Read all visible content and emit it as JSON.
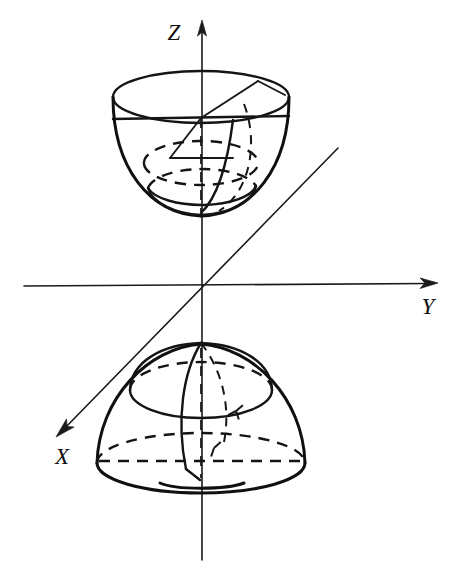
{
  "figure": {
    "background_color": "#ffffff",
    "ink_color": "#101010",
    "width": 467,
    "height": 576
  },
  "axes": {
    "origin": {
      "x": 201,
      "y": 285
    },
    "items": [
      {
        "name": "z-axis",
        "label": "Z",
        "label_x": 174,
        "label_y": 36,
        "direction": "up",
        "start": {
          "x": 202,
          "y": 560
        },
        "end": {
          "x": 202,
          "y": 22
        },
        "arrow": true
      },
      {
        "name": "y-axis",
        "label": "Y",
        "label_x": 424,
        "label_y": 311,
        "direction": "right",
        "start": {
          "x": 24,
          "y": 285
        },
        "end": {
          "x": 437,
          "y": 283
        },
        "arrow": true
      },
      {
        "name": "x-axis",
        "label": "X",
        "label_x": 56,
        "label_y": 462,
        "direction": "down-left",
        "start": {
          "x": 338,
          "y": 148
        },
        "end": {
          "x": 57,
          "y": 435
        },
        "arrow": true
      }
    ]
  },
  "shapes": {
    "upper": {
      "name": "upper-bowl",
      "description": "Upper nappe: bowl opening upward with inscribed sphere",
      "rim_center": {
        "x": 201,
        "y": 96
      },
      "rim_rx": 88,
      "rim_ry": 26,
      "bowl_bottom": {
        "x": 201,
        "y": 215
      },
      "inner_sphere_center": {
        "x": 201,
        "y": 168
      },
      "inner_sphere_rx": 55,
      "inner_sphere_ry": 44
    },
    "lower": {
      "name": "lower-dome",
      "description": "Lower nappe: dome with apex at Z-axis and inscribed sphere",
      "apex": {
        "x": 201,
        "y": 345
      },
      "base_center": {
        "x": 201,
        "y": 463
      },
      "base_rx": 104,
      "base_ry": 30,
      "inner_sphere_center": {
        "x": 201,
        "y": 397
      },
      "inner_sphere_rx": 62,
      "inner_sphere_ry": 50
    }
  },
  "legend": {
    "visible": false,
    "entries": []
  },
  "annotations": []
}
